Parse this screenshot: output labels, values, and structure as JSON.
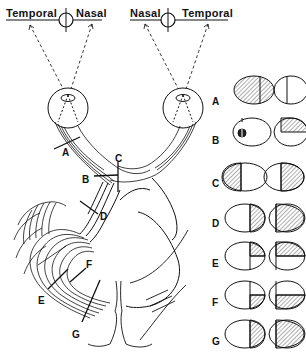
{
  "figure": {
    "left_eye_field": {
      "temporal_label": "Temporal",
      "nasal_label": "Nasal"
    },
    "right_eye_field": {
      "nasal_label": "Nasal",
      "temporal_label": "Temporal"
    },
    "pathway_labels": [
      {
        "id": "A",
        "label": "A",
        "structure": "optic-nerve"
      },
      {
        "id": "B",
        "label": "B",
        "structure": "junction-optic-nerve-chiasm"
      },
      {
        "id": "C",
        "label": "C",
        "structure": "optic-chiasm"
      },
      {
        "id": "D",
        "label": "D",
        "structure": "optic-tract"
      },
      {
        "id": "E",
        "label": "E",
        "structure": "optic-radiation-temporal"
      },
      {
        "id": "F",
        "label": "F",
        "structure": "optic-radiation-parietal"
      },
      {
        "id": "G",
        "label": "G",
        "structure": "occipital-cortex"
      }
    ],
    "field_defects": [
      {
        "row": "A",
        "label": "A",
        "left_eye": "total-loss",
        "right_eye": "normal"
      },
      {
        "row": "B",
        "label": "B",
        "left_eye": "central-scotoma",
        "right_eye": "superior-temporal-quadrant"
      },
      {
        "row": "C",
        "label": "C",
        "left_eye": "temporal-half",
        "right_eye": "temporal-half"
      },
      {
        "row": "D",
        "label": "D",
        "left_eye": "nasal-half",
        "right_eye": "temporal-half"
      },
      {
        "row": "E",
        "label": "E",
        "left_eye": "superior-nasal-quadrant",
        "right_eye": "superior-temporal-quadrant"
      },
      {
        "row": "F",
        "label": "F",
        "left_eye": "inferior-nasal-quadrant",
        "right_eye": "inferior-temporal-quadrant"
      },
      {
        "row": "G",
        "label": "G",
        "left_eye": "nasal-half",
        "right_eye": "temporal-half"
      }
    ],
    "colors": {
      "ink": "#111111",
      "background": "#ffffff",
      "hatch": "#333333"
    }
  }
}
